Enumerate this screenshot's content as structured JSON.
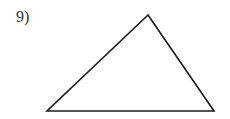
{
  "problem": {
    "number_label": "9)"
  },
  "figure": {
    "type": "triangle",
    "stroke_color": "#1a1a1a",
    "fill_color": "#ffffff",
    "vertices": {
      "top": [
        148,
        15
      ],
      "bottom_left": [
        47,
        111
      ],
      "bottom_right": [
        214,
        111
      ]
    }
  }
}
